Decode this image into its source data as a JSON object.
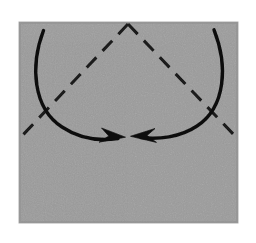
{
  "figure": {
    "type": "origami-fold-diagram",
    "title": "",
    "caption": "",
    "canvas": {
      "width": 256,
      "height": 243,
      "background_color": "#ffffff"
    },
    "paper": {
      "shape": "square-sheet",
      "fill_color": "#a2a2a2",
      "upper_band_color": "#aaaaaa",
      "edge_shadow_color": "#8d8d8d",
      "left": 19,
      "top": 22,
      "right": 238,
      "bottom": 223,
      "texture": "speckled-halftone"
    },
    "creases": [
      {
        "name": "existing-horizontal-crease",
        "style": "faint-solid",
        "color": "#939393",
        "x1": 19,
        "y1": 42,
        "x2": 238,
        "y2": 42
      },
      {
        "name": "existing-vertical-center-crease",
        "style": "faint-solid",
        "color": "#989898",
        "x1": 128,
        "y1": 22,
        "x2": 128,
        "y2": 223
      }
    ],
    "fold_lines": [
      {
        "name": "left-diagonal-fold-line",
        "style": "dashed",
        "color": "#1a1a1a",
        "stroke_width": 3,
        "dash_pattern": "14 9",
        "x1": 128,
        "y1": 24,
        "x2": 20,
        "y2": 138
      },
      {
        "name": "right-diagonal-fold-line",
        "style": "dashed",
        "color": "#1a1a1a",
        "stroke_width": 3,
        "dash_pattern": "14 9",
        "x1": 128,
        "y1": 24,
        "x2": 236,
        "y2": 137
      }
    ],
    "arrows": [
      {
        "name": "left-fold-arrow",
        "direction": "clockwise-inward",
        "color": "#111111",
        "stroke_width": 3.4,
        "start_x": 43,
        "start_y": 31,
        "end_x": 124,
        "end_y": 137,
        "control_x": 38,
        "control_y": 120,
        "arrowhead": "solid-barbed",
        "arrowhead_tip_x": 124,
        "arrowhead_tip_y": 137
      },
      {
        "name": "right-fold-arrow",
        "direction": "counterclockwise-inward",
        "color": "#111111",
        "stroke_width": 3.4,
        "start_x": 214,
        "start_y": 30,
        "end_x": 132,
        "end_y": 136,
        "control_x": 220,
        "control_y": 119,
        "arrowhead": "solid-barbed",
        "arrowhead_tip_x": 132,
        "arrowhead_tip_y": 136
      }
    ],
    "labels": []
  }
}
